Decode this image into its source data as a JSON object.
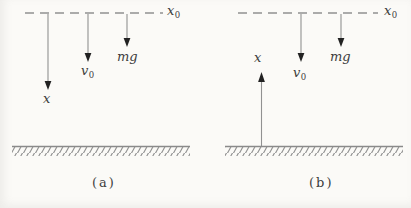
{
  "figure": {
    "colors": {
      "background": "#fbfaf7",
      "line": "#919191",
      "arrowhead": "#222222",
      "text": "#3d3d3d"
    },
    "panel_a": {
      "caption": "(a)",
      "reference_level_label": {
        "base": "x",
        "sub": "0"
      },
      "axis_label": "x",
      "initial_velocity_label": {
        "base": "v",
        "sub": "0"
      },
      "gravity_label": "mg"
    },
    "panel_b": {
      "caption": "(b)",
      "reference_level_label": {
        "base": "x",
        "sub": "0"
      },
      "axis_label": "x",
      "initial_velocity_label": {
        "base": "v",
        "sub": "0"
      },
      "gravity_label": "mg"
    }
  }
}
